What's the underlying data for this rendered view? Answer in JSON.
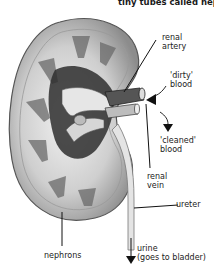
{
  "header": {
    "text": "tiny tubes called nep"
  },
  "labels": {
    "renal_artery": [
      "renal",
      "artery"
    ],
    "dirty_blood": [
      "'dirty'",
      "blood"
    ],
    "cleaned_blood": [
      "'cleaned'",
      "blood"
    ],
    "renal_vein": [
      "renal",
      "vein"
    ],
    "ureter": "ureter",
    "nephrons": "nephrons",
    "urine": [
      "urine",
      "(goes to bladder)"
    ]
  },
  "colors": {
    "ink": "#1a1a1a",
    "kidney_light": "#d8d8d8",
    "kidney_mid": "#9a9a9a",
    "kidney_dark": "#3a3a3a"
  }
}
